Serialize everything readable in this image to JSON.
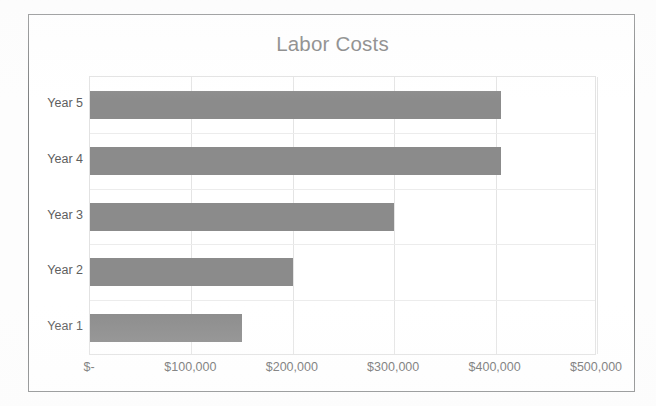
{
  "chart_data": {
    "type": "bar",
    "orientation": "horizontal",
    "title": "Labor Costs",
    "xlabel": "",
    "ylabel": "",
    "categories": [
      "Year 1",
      "Year 2",
      "Year 3",
      "Year 4",
      "Year 5"
    ],
    "values": [
      150000,
      200000,
      300000,
      405000,
      405000
    ],
    "series": [
      {
        "name": "Labor Costs",
        "values": [
          150000,
          200000,
          300000,
          405000,
          405000
        ]
      }
    ],
    "xlim": [
      0,
      500000
    ],
    "xticks": [
      0,
      100000,
      200000,
      300000,
      400000,
      500000
    ],
    "xtick_labels": [
      "$-",
      "$100,000",
      "$200,000",
      "$300,000",
      "$400,000",
      "$500,000"
    ],
    "grid": "vertical-and-horizontal",
    "legend": "none",
    "bar_color": "#8b8b8b",
    "gridline_color": "#e4e4e4",
    "plot_border_color": "#e2e2e2",
    "title_color": "#7a7a7a",
    "label_color": "#5e5e5e",
    "frame_border_color": "#7d7f80",
    "background_color": "#ffffff"
  },
  "rows": [
    {
      "label": "Year 5",
      "value": 405000
    },
    {
      "label": "Year 4",
      "value": 405000
    },
    {
      "label": "Year 3",
      "value": 300000
    },
    {
      "label": "Year 2",
      "value": 200000
    },
    {
      "label": "Year 1",
      "value": 150000
    }
  ]
}
